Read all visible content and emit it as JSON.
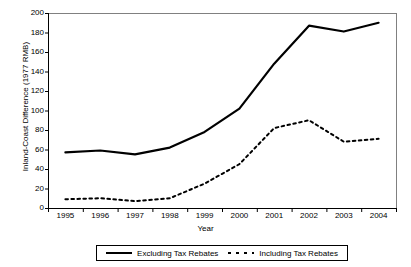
{
  "chart_data": {
    "type": "line",
    "title": "",
    "xlabel": "Year",
    "ylabel": "Inland-Coast Difference (1977 RMB)",
    "categories": [
      "1995",
      "1996",
      "1997",
      "1998",
      "1999",
      "2000",
      "2001",
      "2002",
      "2003",
      "2004"
    ],
    "x": [
      1995,
      1996,
      1997,
      1998,
      1999,
      2000,
      2001,
      2002,
      2003,
      2004
    ],
    "ylim": [
      0,
      200
    ],
    "yticks": [
      0,
      20,
      40,
      60,
      80,
      100,
      120,
      140,
      160,
      180,
      200
    ],
    "ytick_labels": [
      "0",
      "20",
      "40",
      "60",
      "80",
      "100",
      "120",
      "140",
      "160",
      "180",
      "200"
    ],
    "grid": false,
    "legend_position": "bottom",
    "series": [
      {
        "name": "Excluding Tax Rebates",
        "style": "solid",
        "color": "#000000",
        "values": [
          57,
          59,
          55,
          62,
          78,
          102,
          148,
          187,
          181,
          190
        ]
      },
      {
        "name": "Including Tax Rebates",
        "style": "dotted",
        "color": "#000000",
        "values": [
          9,
          10,
          7,
          10,
          25,
          45,
          82,
          90,
          68,
          71
        ]
      }
    ]
  },
  "legend": {
    "entries": [
      {
        "label": "Excluding Tax Rebates"
      },
      {
        "label": "Including Tax Rebates"
      }
    ]
  },
  "axes": {
    "frame_color": "#808080",
    "tick_color": "#000000"
  }
}
